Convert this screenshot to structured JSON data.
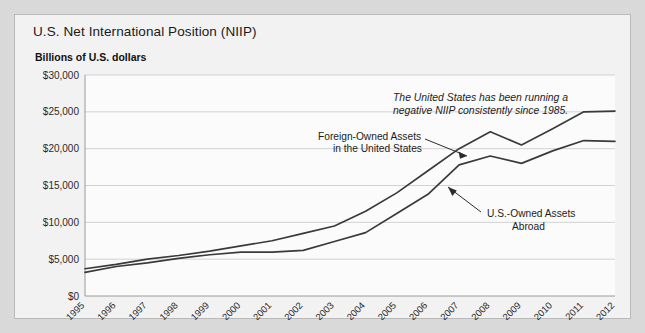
{
  "figure": {
    "title": "U.S. Net International Position (NIIP)",
    "unit_label": "Billions of U.S. dollars"
  },
  "annotations": {
    "note_line1": "The United States has been running a",
    "note_line2": "negative NIIP consistently since 1985.",
    "foreign_label_line1": "Foreign-Owned Assets",
    "foreign_label_line2": "in the United States",
    "usowned_label_line1": "U.S.-Owned Assets",
    "usowned_label_line2": "Abroad"
  },
  "colors": {
    "page_background": "#d9d9d9",
    "figure_background": "#f2f2f2",
    "plot_background": "#fbfbfb",
    "line": "#3a3a3a",
    "gridline": "#d2d2d2",
    "text": "#1a1a1a"
  },
  "chart_data": {
    "type": "line",
    "title": "U.S. Net International Position (NIIP)",
    "xlabel": "",
    "ylabel": "Billions of U.S. dollars",
    "ylim": [
      0,
      30000
    ],
    "yticks": [
      0,
      5000,
      10000,
      15000,
      20000,
      25000,
      30000
    ],
    "ytick_labels": [
      "$0",
      "$5,000",
      "$10,000",
      "$15,000",
      "$20,000",
      "$25,000",
      "$30,000"
    ],
    "grid": true,
    "legend_position": "inline-annotations",
    "x": [
      1995,
      1996,
      1997,
      1998,
      1999,
      2000,
      2001,
      2002,
      2003,
      2004,
      2005,
      2006,
      2007,
      2008,
      2009,
      2010,
      2011,
      2012
    ],
    "xtick_labels": [
      "1995",
      "1996",
      "1997",
      "1998",
      "1999",
      "2000",
      "2001",
      "2002",
      "2003",
      "2004",
      "2005",
      "2006",
      "2007",
      "2008",
      "2009",
      "2010",
      "2011",
      "2012"
    ],
    "series": [
      {
        "name": "Foreign-Owned Assets in the United States",
        "values": [
          3700,
          4300,
          5000,
          5500,
          6100,
          6800,
          7500,
          8500,
          9500,
          11500,
          14000,
          17000,
          20000,
          22300,
          20500,
          22700,
          25000,
          25100
        ]
      },
      {
        "name": "U.S.-Owned Assets Abroad",
        "values": [
          3200,
          4000,
          4500,
          5100,
          5600,
          5950,
          5950,
          6200,
          7400,
          8600,
          11200,
          13800,
          17800,
          19000,
          18000,
          19700,
          21100,
          21000
        ]
      }
    ]
  }
}
